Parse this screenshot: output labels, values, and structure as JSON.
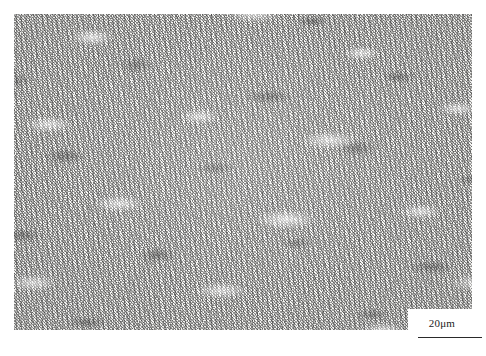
{
  "figure": {
    "kind": "optical-micrograph",
    "background_color": "#ffffff",
    "plate": {
      "x": 14,
      "y": 14,
      "width": 458,
      "height": 316,
      "base_color": "#f2f2f0",
      "feature_color": "#282828"
    }
  },
  "scalebar": {
    "label": "20μm",
    "value": 20,
    "unit": "μm",
    "bar_length_px": 64,
    "line_color": "#2a2a2a",
    "box_color": "#ffffff"
  }
}
